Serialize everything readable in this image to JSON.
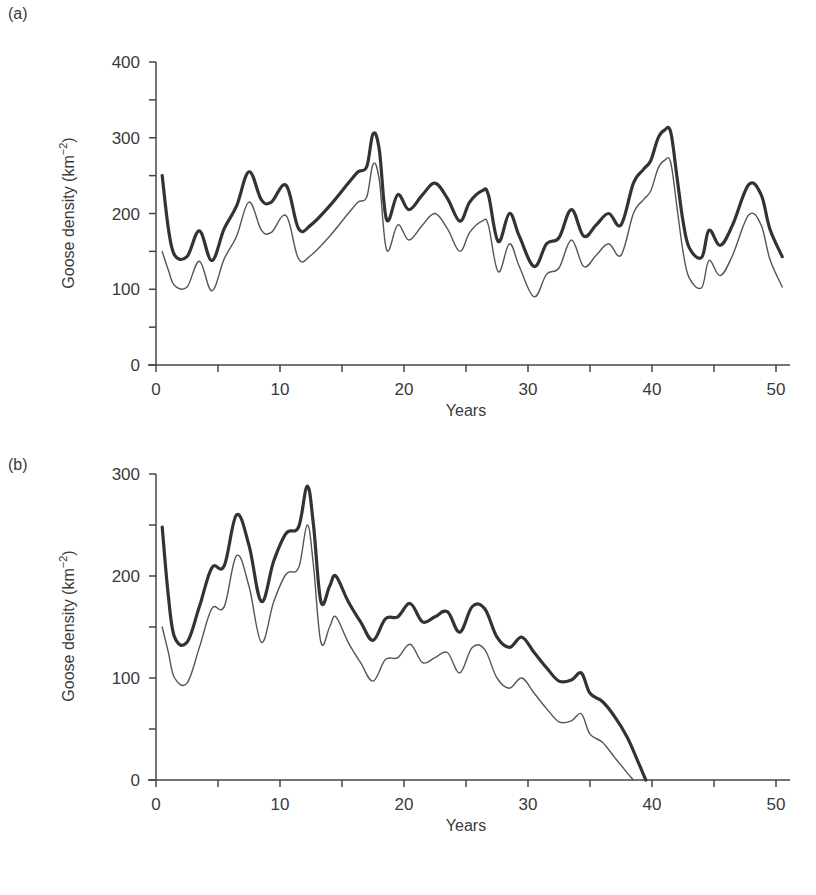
{
  "chart_data": [
    {
      "type": "line",
      "panel_label": "(a)",
      "title": "",
      "xlabel": "Years",
      "ylabel": "Goose density (km⁻²)",
      "ylabel_main": "Goose density (km",
      "ylabel_sup": "−2",
      "ylabel_close": ")",
      "xlim": [
        0,
        51
      ],
      "ylim": [
        0,
        400
      ],
      "xticks": [
        0,
        10,
        20,
        30,
        40,
        50
      ],
      "yticks": [
        0,
        100,
        200,
        300,
        400
      ],
      "grid": false,
      "legend": "none",
      "series": [
        {
          "name": "thick line (upper)",
          "x": [
            0.5,
            1.0,
            1.5,
            2.5,
            3.5,
            4.5,
            5.5,
            6.5,
            7.5,
            8.5,
            9.3,
            10.5,
            11.5,
            12.5,
            14.0,
            15.5,
            16.3,
            17.0,
            17.5,
            18.0,
            18.6,
            19.5,
            20.4,
            21.5,
            22.5,
            23.5,
            24.5,
            25.3,
            26.3,
            26.8,
            27.6,
            28.5,
            29.3,
            30.5,
            31.5,
            32.5,
            33.5,
            34.5,
            35.5,
            36.5,
            37.5,
            38.5,
            39.3,
            39.9,
            40.5,
            41.0,
            41.5,
            42.0,
            42.5,
            43.0,
            44.0,
            44.6,
            45.5,
            46.5,
            47.8,
            48.8,
            49.5,
            50.5
          ],
          "values": [
            250,
            180,
            145,
            143,
            177,
            138,
            180,
            210,
            255,
            218,
            215,
            237,
            180,
            185,
            210,
            240,
            255,
            262,
            305,
            285,
            192,
            225,
            205,
            225,
            240,
            220,
            190,
            215,
            230,
            225,
            163,
            200,
            170,
            130,
            160,
            168,
            205,
            170,
            185,
            200,
            185,
            240,
            258,
            270,
            300,
            310,
            308,
            250,
            190,
            155,
            142,
            178,
            158,
            185,
            238,
            225,
            180,
            143
          ]
        },
        {
          "name": "thin line (lower)",
          "x": [
            0.5,
            1.0,
            1.5,
            2.5,
            3.5,
            4.5,
            5.5,
            6.5,
            7.5,
            8.5,
            9.3,
            10.5,
            11.5,
            12.5,
            14.0,
            15.5,
            16.3,
            17.0,
            17.5,
            18.0,
            18.6,
            19.5,
            20.4,
            21.5,
            22.5,
            23.5,
            24.5,
            25.3,
            26.3,
            26.8,
            27.6,
            28.5,
            29.3,
            30.5,
            31.5,
            32.5,
            33.5,
            34.5,
            35.5,
            36.5,
            37.5,
            38.5,
            39.3,
            39.9,
            40.5,
            41.0,
            41.5,
            42.0,
            42.5,
            43.0,
            44.0,
            44.6,
            45.5,
            46.5,
            47.8,
            48.8,
            49.5,
            50.5
          ],
          "values": [
            150,
            125,
            105,
            103,
            137,
            98,
            140,
            170,
            215,
            178,
            175,
            197,
            140,
            145,
            170,
            200,
            215,
            222,
            265,
            245,
            152,
            185,
            165,
            185,
            200,
            180,
            150,
            175,
            190,
            185,
            123,
            160,
            130,
            90,
            120,
            128,
            165,
            130,
            145,
            160,
            145,
            200,
            218,
            230,
            260,
            270,
            268,
            210,
            150,
            115,
            102,
            138,
            118,
            145,
            198,
            185,
            140,
            103
          ]
        }
      ]
    },
    {
      "type": "line",
      "panel_label": "(b)",
      "title": "",
      "xlabel": "Years",
      "ylabel": "Goose density (km⁻²)",
      "ylabel_main": "Goose density (km",
      "ylabel_sup": "−2",
      "ylabel_close": ")",
      "xlim": [
        0,
        51
      ],
      "ylim": [
        0,
        300
      ],
      "xticks": [
        0,
        10,
        20,
        30,
        40,
        50
      ],
      "yticks": [
        0,
        100,
        200,
        300
      ],
      "grid": false,
      "legend": "none",
      "series": [
        {
          "name": "thick line (upper)",
          "x": [
            0.5,
            1.0,
            1.5,
            2.5,
            3.5,
            4.5,
            5.5,
            6.5,
            7.5,
            8.5,
            9.5,
            10.5,
            11.5,
            12.2,
            12.7,
            13.3,
            14.0,
            14.5,
            15.5,
            16.5,
            17.5,
            18.5,
            19.5,
            20.5,
            21.5,
            22.5,
            23.5,
            24.5,
            25.5,
            26.5,
            27.5,
            28.5,
            29.5,
            30.5,
            31.5,
            32.5,
            33.5,
            34.3,
            35.0,
            36.0,
            37.0,
            38.0,
            38.8,
            39.5
          ],
          "values": [
            248,
            180,
            140,
            135,
            170,
            208,
            210,
            260,
            230,
            175,
            215,
            242,
            248,
            288,
            250,
            175,
            190,
            200,
            175,
            155,
            137,
            158,
            160,
            173,
            155,
            160,
            165,
            145,
            170,
            168,
            140,
            130,
            140,
            125,
            110,
            97,
            98,
            105,
            85,
            77,
            62,
            42,
            20,
            0
          ]
        },
        {
          "name": "thin line (lower)",
          "x": [
            0.5,
            1.0,
            1.5,
            2.5,
            3.5,
            4.5,
            5.5,
            6.5,
            7.5,
            8.5,
            9.5,
            10.5,
            11.5,
            12.2,
            12.7,
            13.3,
            14.0,
            14.5,
            15.5,
            16.5,
            17.5,
            18.5,
            19.5,
            20.5,
            21.5,
            22.5,
            23.5,
            24.5,
            25.5,
            26.5,
            27.5,
            28.5,
            29.5,
            30.5,
            31.5,
            32.5,
            33.5,
            34.3,
            35.0,
            36.0,
            37.0,
            38.0,
            38.5
          ],
          "values": [
            150,
            125,
            100,
            95,
            130,
            168,
            170,
            220,
            190,
            135,
            175,
            202,
            208,
            250,
            210,
            135,
            150,
            160,
            135,
            115,
            97,
            118,
            120,
            133,
            115,
            120,
            125,
            105,
            130,
            128,
            100,
            90,
            100,
            85,
            70,
            57,
            58,
            65,
            45,
            37,
            22,
            7,
            0
          ]
        }
      ]
    }
  ]
}
